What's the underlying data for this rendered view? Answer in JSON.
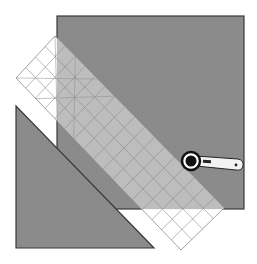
{
  "diagram": {
    "colors": {
      "background": "#ffffff",
      "fabric": "#8c8c8c",
      "fabric_edge": "#3a3a3a",
      "ruler_fill": "#ffffff",
      "ruler_over_fabric": "#bdbdbd",
      "ruler_grid": "#8a8a8a",
      "cutter_handle": "#f2f2f2",
      "cutter_blade": "#111111"
    },
    "elements": {
      "fabric_square": {
        "label": "fabric square",
        "x": 57,
        "y": 16,
        "width": 187,
        "height": 193
      },
      "cut_triangle": {
        "label": "cut-off triangle",
        "points": [
          [
            16,
            106
          ],
          [
            16,
            248
          ],
          [
            154,
            248
          ]
        ]
      },
      "ruler": {
        "label": "gridded ruler",
        "top": [
          55,
          36
        ],
        "right": [
          224,
          208
        ],
        "bottom": [
          181,
          250
        ],
        "left": [
          16,
          78
        ],
        "grid_columns": 4,
        "grid_rows": 17
      },
      "rotary_cutter": {
        "label": "rotary cutter",
        "blade_center": [
          191,
          161
        ],
        "blade_radius": 8
      }
    }
  }
}
